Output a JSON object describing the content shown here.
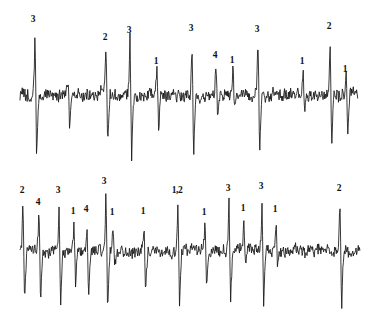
{
  "figure": {
    "background_color": "#ffffff",
    "trace_color": "#151515",
    "label_color": "#111111",
    "width": 376,
    "height": 322
  },
  "chart_data": {
    "type": "line",
    "subtitle": "",
    "xlabel": "",
    "ylabel": "",
    "grid": false,
    "legend": "none",
    "axis_visible": false,
    "tick_labels": [],
    "panels": [
      {
        "name": "trace-1",
        "index": 1,
        "baseline_y": 95,
        "x_range": [
          20,
          358
        ],
        "annotations": [
          {
            "text": "3",
            "x": 33,
            "y": 15,
            "unit": 3
          },
          {
            "text": "2",
            "x": 105,
            "y": 33,
            "unit": 2
          },
          {
            "text": "3",
            "x": 129,
            "y": 26,
            "unit": 3
          },
          {
            "text": "1",
            "x": 156,
            "y": 57,
            "unit": 1
          },
          {
            "text": "3",
            "x": 191,
            "y": 24,
            "unit": 3
          },
          {
            "text": "4",
            "x": 215,
            "y": 51,
            "unit": 4
          },
          {
            "text": "1",
            "x": 232,
            "y": 56,
            "unit": 1
          },
          {
            "text": "3",
            "x": 257,
            "y": 25,
            "unit": 3
          },
          {
            "text": "1",
            "x": 302,
            "y": 57,
            "unit": 1
          },
          {
            "text": "2",
            "x": 329,
            "y": 22,
            "unit": 2
          },
          {
            "text": "1",
            "x": 345,
            "y": 65,
            "unit": 1
          }
        ],
        "spikes": [
          {
            "x": 35,
            "amp_up": 58,
            "amp_down": 62,
            "unit": 3
          },
          {
            "x": 68,
            "amp_up": 12,
            "amp_down": 38,
            "unit": null
          },
          {
            "x": 106,
            "amp_up": 52,
            "amp_down": 50,
            "unit": 2
          },
          {
            "x": 130,
            "amp_up": 57,
            "amp_down": 70,
            "unit": 3
          },
          {
            "x": 157,
            "amp_up": 28,
            "amp_down": 40,
            "unit": 1
          },
          {
            "x": 192,
            "amp_up": 58,
            "amp_down": 62,
            "unit": 3
          },
          {
            "x": 216,
            "amp_up": 32,
            "amp_down": 30,
            "unit": 4
          },
          {
            "x": 233,
            "amp_up": 28,
            "amp_down": 12,
            "unit": 1
          },
          {
            "x": 258,
            "amp_up": 58,
            "amp_down": 62,
            "unit": 3
          },
          {
            "x": 303,
            "amp_up": 30,
            "amp_down": 14,
            "unit": 1
          },
          {
            "x": 330,
            "amp_up": 56,
            "amp_down": 50,
            "unit": 2
          },
          {
            "x": 346,
            "amp_up": 24,
            "amp_down": 44,
            "unit": 1
          }
        ]
      },
      {
        "name": "trace-2",
        "index": 2,
        "baseline_y": 90,
        "x_range": [
          20,
          360
        ],
        "annotations": [
          {
            "text": "2",
            "x": 22,
            "y": 25,
            "unit": 2
          },
          {
            "text": "4",
            "x": 38,
            "y": 37,
            "unit": 4
          },
          {
            "text": "3",
            "x": 58,
            "y": 25,
            "unit": 3
          },
          {
            "text": "1",
            "x": 73,
            "y": 46,
            "unit": 1
          },
          {
            "text": "4",
            "x": 86,
            "y": 44,
            "unit": 4
          },
          {
            "text": "3",
            "x": 104,
            "y": 16,
            "unit": 3
          },
          {
            "text": "1",
            "x": 112,
            "y": 47,
            "unit": 1
          },
          {
            "text": "1",
            "x": 143,
            "y": 46,
            "unit": 1
          },
          {
            "text": "1,2",
            "x": 177,
            "y": 25,
            "unit": "1,2"
          },
          {
            "text": "1",
            "x": 204,
            "y": 47,
            "unit": 1
          },
          {
            "text": "3",
            "x": 228,
            "y": 23,
            "unit": 3
          },
          {
            "text": "1",
            "x": 243,
            "y": 43,
            "unit": 1
          },
          {
            "text": "3",
            "x": 261,
            "y": 21,
            "unit": 3
          },
          {
            "text": "1",
            "x": 275,
            "y": 44,
            "unit": 1
          },
          {
            "text": "2",
            "x": 339,
            "y": 23,
            "unit": 2
          }
        ],
        "spikes": [
          {
            "x": 23,
            "amp_up": 50,
            "amp_down": 52,
            "unit": 2
          },
          {
            "x": 39,
            "amp_up": 38,
            "amp_down": 56,
            "unit": 4
          },
          {
            "x": 59,
            "amp_up": 50,
            "amp_down": 62,
            "unit": 3
          },
          {
            "x": 74,
            "amp_up": 28,
            "amp_down": 38,
            "unit": 1
          },
          {
            "x": 87,
            "amp_up": 30,
            "amp_down": 50,
            "unit": 4
          },
          {
            "x": 106,
            "amp_up": 62,
            "amp_down": 70,
            "unit": 3
          },
          {
            "x": 113,
            "amp_up": 28,
            "amp_down": 16,
            "unit": 1
          },
          {
            "x": 144,
            "amp_up": 28,
            "amp_down": 42,
            "unit": 1
          },
          {
            "x": 178,
            "amp_up": 52,
            "amp_down": 54,
            "unit": "1,2"
          },
          {
            "x": 205,
            "amp_up": 28,
            "amp_down": 44,
            "unit": 1
          },
          {
            "x": 229,
            "amp_up": 50,
            "amp_down": 54,
            "unit": 3
          },
          {
            "x": 244,
            "amp_up": 34,
            "amp_down": 16,
            "unit": 1
          },
          {
            "x": 262,
            "amp_up": 54,
            "amp_down": 52,
            "unit": 3
          },
          {
            "x": 276,
            "amp_up": 32,
            "amp_down": 18,
            "unit": 1
          },
          {
            "x": 340,
            "amp_up": 52,
            "amp_down": 56,
            "unit": 2
          }
        ]
      }
    ]
  }
}
